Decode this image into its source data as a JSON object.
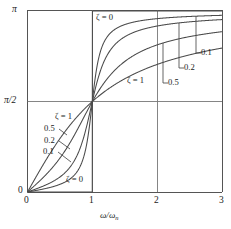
{
  "chart_data": {
    "type": "line",
    "title": "",
    "xlabel": "ω/ωₙ",
    "ylabel": "",
    "xlim": [
      0,
      3
    ],
    "ylim": [
      0,
      3.14159265
    ],
    "grid": true,
    "gridlines_x": [
      1,
      2
    ],
    "gridlines_y": [
      1.5707963
    ],
    "xticks": [
      0,
      1,
      2,
      3
    ],
    "xticklabels": [
      "0",
      "1",
      "2",
      "3"
    ],
    "yticks": [
      0,
      1.5707963,
      3.14159265
    ],
    "yticklabels": [
      "0",
      "π/2",
      "π"
    ],
    "legend_position": "inline-annotations",
    "formula": "phi = atan2(2*zeta*r, 1 - r^2)",
    "series": [
      {
        "name": "ζ = 0",
        "zeta": 0.0
      },
      {
        "name": "0.1",
        "zeta": 0.1
      },
      {
        "name": "0.2",
        "zeta": 0.2
      },
      {
        "name": "0.5",
        "zeta": 0.5
      },
      {
        "name": "ζ = 1",
        "zeta": 1.0
      }
    ],
    "annotations": [
      {
        "text": "ζ = 0",
        "region": "upper-left",
        "zeta": 0.0
      },
      {
        "text": "ζ = 1",
        "region": "upper-middle",
        "zeta": 1.0
      },
      {
        "text": "0.1",
        "region": "right",
        "zeta": 0.1
      },
      {
        "text": "0.2",
        "region": "right",
        "zeta": 0.2
      },
      {
        "text": "0.5",
        "region": "right",
        "zeta": 0.5
      },
      {
        "text": "ζ = 1",
        "region": "lower-left",
        "zeta": 1.0
      },
      {
        "text": "0.5",
        "region": "lower-left",
        "zeta": 0.5
      },
      {
        "text": "0.2",
        "region": "lower-left",
        "zeta": 0.2
      },
      {
        "text": "0.1",
        "region": "lower-left",
        "zeta": 0.1
      },
      {
        "text": "ζ = 0",
        "region": "lower-middle",
        "zeta": 0.0
      }
    ],
    "colors": {
      "axis": "#555555",
      "grid": "#777777",
      "curve": "#4a4a4a",
      "background": "#ffffff"
    }
  },
  "axis": {
    "y_top_label": "π",
    "y_mid_label": "π/2",
    "y_zero_label": "0",
    "x_zero_label": "0",
    "x_one_label": "1",
    "x_two_label": "2",
    "x_three_label": "3",
    "x_axis_title_num": "ω",
    "x_axis_title_den": "ω",
    "x_axis_title_sub": "n"
  },
  "labels": {
    "top_zeta0": "ζ = 0",
    "upper_zeta1": "ζ = 1",
    "right_01": "0.1",
    "right_02": "0.2",
    "right_05": "0.5",
    "ll_zeta1": "ζ = 1",
    "ll_05": "0.5",
    "ll_02": "0.2",
    "ll_01": "0.1",
    "lower_zeta0": "ζ = 0"
  }
}
